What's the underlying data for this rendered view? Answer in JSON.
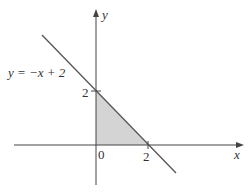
{
  "diagram": {
    "type": "coordinate-plane",
    "colors": {
      "axis": "#444444",
      "line": "#555555",
      "fill": "#d4d4d4",
      "text": "#333333"
    },
    "axes": {
      "x_label": "x",
      "y_label": "y",
      "origin_label": "0"
    },
    "ticks": {
      "x_tick_label": "2",
      "y_tick_label": "2"
    },
    "line": {
      "equation_label": "y = −x + 2",
      "slope": -1,
      "intercept": 2
    },
    "shaded_region": {
      "description": "triangle bounded by x-axis, y-axis and y = −x + 2",
      "vertices": [
        [
          0,
          0
        ],
        [
          2,
          0
        ],
        [
          0,
          2
        ]
      ]
    }
  }
}
